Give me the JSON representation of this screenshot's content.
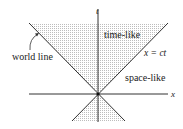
{
  "diagram": {
    "type": "spacetime light cone",
    "axes": {
      "horizontal": "x",
      "vertical": "t"
    },
    "regions": {
      "inside_cone": "time-like",
      "outside_cone": "space-like"
    },
    "cone_line_label": "x = ct",
    "annotation": "world line",
    "colors": {
      "line": "#333333",
      "shade": "#c8c8c8",
      "background": "#ffffff"
    }
  }
}
